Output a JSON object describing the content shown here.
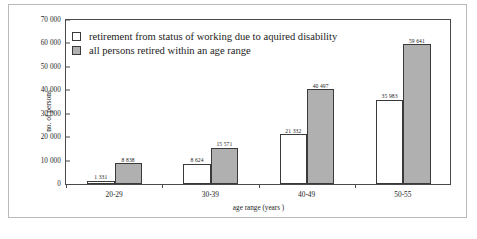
{
  "chart_data": {
    "type": "bar",
    "title": "",
    "xlabel": "age range (years )",
    "ylabel": "no. of persons",
    "categories": [
      "20-29",
      "30-39",
      "40-49",
      "50-55"
    ],
    "series": [
      {
        "name": "retirement from status of working due to aquired disability",
        "swatch": "light",
        "values": [
          1331,
          8624,
          21332,
          35983
        ],
        "value_labels": [
          "1 331",
          "8 624",
          "21 332",
          "35 983"
        ]
      },
      {
        "name": "all persons retired within an age range",
        "swatch": "dark",
        "values": [
          8838,
          15571,
          40497,
          59641
        ],
        "value_labels": [
          "8 838",
          "15 571",
          "40 497",
          "59 641"
        ]
      }
    ],
    "ylim": [
      0,
      70000
    ],
    "ytick_values": [
      0,
      10000,
      20000,
      30000,
      40000,
      50000,
      60000,
      70000
    ],
    "ytick_labels": [
      "0",
      "10 000",
      "20 000",
      "30 000",
      "40 000",
      "50 000",
      "60 000",
      "70 000"
    ],
    "grid": false,
    "legend_position": "upper-left-inside",
    "colors": {
      "series_light_fill": "#ffffff",
      "series_dark_fill": "#b0b0b0",
      "bar_outline": "#3a3a3a",
      "axis": "#4a4a4a",
      "frame": "#b9b9b9",
      "text": "#1c1c1c",
      "background": "#ffffff"
    }
  },
  "legend": {
    "items": [
      {
        "label": "retirement from status of working due to aquired disability",
        "swatch": "light"
      },
      {
        "label": "all persons retired within an age range",
        "swatch": "dark"
      }
    ]
  },
  "caption": {
    "text": ""
  }
}
